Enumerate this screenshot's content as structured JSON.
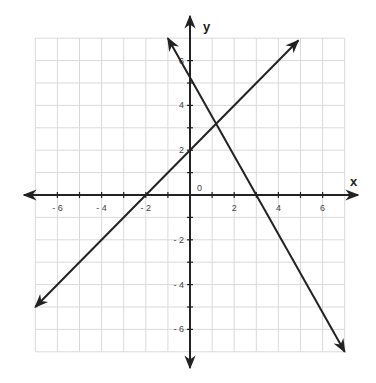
{
  "chart_data": {
    "type": "line",
    "title": "",
    "xlabel": "x",
    "ylabel": "y",
    "origin_label": "0",
    "xlim": [
      -7,
      7
    ],
    "ylim": [
      -7,
      7
    ],
    "grid": true,
    "grid_step": 1,
    "x_tick_labels": [
      {
        "value": -6,
        "label": "- 6"
      },
      {
        "value": -4,
        "label": "- 4"
      },
      {
        "value": -2,
        "label": "- 2"
      },
      {
        "value": 2,
        "label": "2"
      },
      {
        "value": 4,
        "label": "4"
      },
      {
        "value": 6,
        "label": "6"
      }
    ],
    "y_tick_labels": [
      {
        "value": 6,
        "label": "6"
      },
      {
        "value": 4,
        "label": "4"
      },
      {
        "value": 2,
        "label": "2"
      },
      {
        "value": -2,
        "label": "- 2"
      },
      {
        "value": -4,
        "label": "- 4"
      },
      {
        "value": -6,
        "label": "- 6"
      }
    ],
    "series": [
      {
        "name": "line-1",
        "equation": "y = x + 2",
        "slope": 1,
        "intercept": 2,
        "x": [
          -7,
          4.9
        ],
        "y": [
          -5,
          6.9
        ],
        "arrows": "both"
      },
      {
        "name": "line-2",
        "equation": "y = -1.75x + 5.25",
        "slope": -1.75,
        "intercept": 5.25,
        "x": [
          -1,
          7
        ],
        "y": [
          7,
          -7
        ],
        "arrows": "both"
      }
    ],
    "annotations": [
      {
        "type": "intersection",
        "x": 1.18,
        "y": 3.18
      }
    ],
    "colors": {
      "grid": "#d9d9d9",
      "axis": "#222222",
      "line": "#222222"
    }
  }
}
